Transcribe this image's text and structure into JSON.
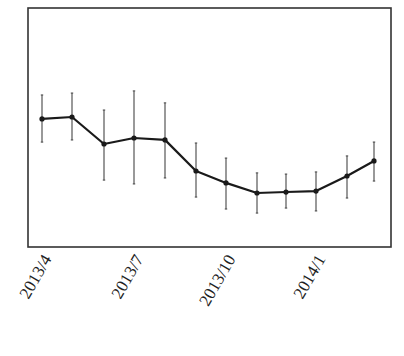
{
  "chart_data": {
    "type": "line",
    "title": "",
    "xlabel": "",
    "ylabel": "",
    "grid": false,
    "legend": null,
    "error_bars": true,
    "y_units": "relative (no y-axis ticks shown; 0 = plot bottom, 100 = plot top)",
    "ylim": [
      0,
      100
    ],
    "x": [
      "2013/4",
      "2013/5",
      "2013/6",
      "2013/7",
      "2013/8",
      "2013/9",
      "2013/10",
      "2013/11",
      "2013/12",
      "2014/1",
      "2014/2",
      "2014/3"
    ],
    "x_tick_labels": [
      "2013/4",
      "2013/7",
      "2013/10",
      "2014/1"
    ],
    "x_tick_indices": [
      0,
      3,
      6,
      9
    ],
    "series": [
      {
        "name": "",
        "values": [
          53.6,
          54.4,
          43.1,
          45.6,
          44.8,
          31.8,
          26.8,
          22.6,
          23.0,
          23.4,
          29.7,
          36.0
        ],
        "upper": [
          63.6,
          64.4,
          57.3,
          65.3,
          60.3,
          43.5,
          37.2,
          31.0,
          30.5,
          31.4,
          38.1,
          43.9
        ],
        "lower": [
          43.9,
          44.8,
          28.0,
          26.4,
          28.9,
          20.9,
          15.9,
          14.2,
          16.3,
          15.1,
          20.5,
          27.6
        ]
      }
    ]
  },
  "layout": {
    "plot": {
      "left": 28,
      "top": 8,
      "right": 391,
      "bottom": 247
    },
    "x_px": [
      42,
      72,
      104,
      134,
      165,
      196,
      226,
      257,
      286,
      316,
      347,
      374
    ],
    "line_color": "#1a1a1a",
    "frame_color": "#333333",
    "errorbar_color": "#555555"
  }
}
